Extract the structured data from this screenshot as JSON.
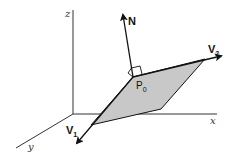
{
  "diagram": {
    "axes": {
      "x": {
        "label": "x"
      },
      "y": {
        "label": "y"
      },
      "z": {
        "label": "z"
      }
    },
    "vectors": {
      "normal": {
        "label": "N"
      },
      "v1": {
        "label": "V",
        "subscript": "1"
      },
      "v2": {
        "label": "V",
        "subscript": "2"
      }
    },
    "point": {
      "label": "P",
      "subscript": "0"
    },
    "colors": {
      "plane_fill": "#c8c8c8",
      "line": "#111111",
      "axis": "#333333"
    }
  }
}
